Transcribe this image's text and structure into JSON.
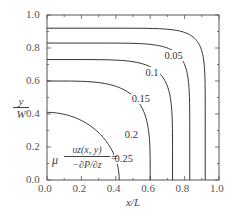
{
  "chart_data": {
    "type": "line",
    "subtype": "contour",
    "title": "",
    "xlabel": "x/L",
    "ylabel": "y/W",
    "xlim": [
      0.0,
      1.0
    ],
    "ylim": [
      0.0,
      1.0
    ],
    "xticks": [
      "0.0",
      "0.2",
      "0.4",
      "0.6",
      "0.8",
      "1.0"
    ],
    "yticks": [
      "0.0",
      "0.2",
      "0.4",
      "0.6",
      "0.8",
      "1.0"
    ],
    "grid": false,
    "annotation": {
      "mu": "μ",
      "numerator": "υz(x, y)",
      "denominator": "−∂P/∂z",
      "equals": "="
    },
    "series": [
      {
        "name": "0.05",
        "level": 0.05,
        "x_intercept": 0.92,
        "y_intercept": 0.92,
        "label_pos": [
          0.7,
          0.75
        ]
      },
      {
        "name": "0.1",
        "level": 0.1,
        "x_intercept": 0.83,
        "y_intercept": 0.83,
        "label_pos": [
          0.59,
          0.65
        ]
      },
      {
        "name": "0.15",
        "level": 0.15,
        "x_intercept": 0.73,
        "y_intercept": 0.73,
        "label_pos": [
          0.51,
          0.49
        ]
      },
      {
        "name": "0.2",
        "level": 0.2,
        "x_intercept": 0.6,
        "y_intercept": 0.6,
        "label_pos": [
          0.47,
          0.27
        ]
      },
      {
        "name": "0.25",
        "level": 0.25,
        "x_intercept": 0.42,
        "y_intercept": 0.41,
        "label_pos": [
          0.41,
          0.13
        ]
      }
    ]
  }
}
